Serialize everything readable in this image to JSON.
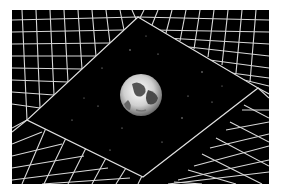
{
  "image": {
    "description": "Earth floating in starry space, framed by a perspective wireframe grid tunnel",
    "colors": {
      "background": "#000000",
      "grid": "#d8d8d8",
      "page": "#ffffff",
      "earth_light": "#f2f2f2",
      "earth_dark": "#3a3a3a"
    },
    "caption": "Earth in a grid tunnel"
  }
}
